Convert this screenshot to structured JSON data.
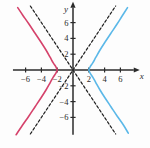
{
  "figure": {
    "background": "#fdfdfd"
  },
  "chart_data": {
    "type": "line",
    "title": "",
    "subtitle": "",
    "xlabel": "x",
    "ylabel": "y",
    "xlim": [
      -7.6,
      8.2
    ],
    "ylim": [
      -8.2,
      8.4
    ],
    "grid": false,
    "legend": null,
    "x_ticks": [
      -6,
      -4,
      -2,
      2,
      4,
      6
    ],
    "y_ticks": [
      6,
      4,
      2,
      -2,
      -4,
      -6
    ],
    "x_tick_labels": [
      "−6",
      "−4",
      "−2",
      "2",
      "4",
      "6"
    ],
    "y_tick_labels": [
      "6",
      "4",
      "2",
      "−2",
      "−4",
      "−6"
    ],
    "origin_label": "",
    "annotations": [],
    "equation": "x²/4 − y²/9 = 1",
    "series": [
      {
        "name": "left-branch",
        "role": "hyperbola-branch",
        "color": "#d5426b",
        "style": "solid",
        "width": 1.6,
        "vertex": [
          -2,
          0
        ],
        "points": [
          [
            -7.2,
            -8.2
          ],
          [
            -6.4,
            -7.0
          ],
          [
            -5.6,
            -5.85
          ],
          [
            -4.8,
            -4.65
          ],
          [
            -4.0,
            -3.45
          ],
          [
            -3.4,
            -2.5
          ],
          [
            -2.9,
            -1.62
          ],
          [
            -2.5,
            -0.9
          ],
          [
            -2.2,
            -0.45
          ],
          [
            -2.05,
            -0.15
          ],
          [
            -2.0,
            0.0
          ],
          [
            -2.05,
            0.15
          ],
          [
            -2.2,
            0.45
          ],
          [
            -2.5,
            0.9
          ],
          [
            -2.9,
            1.62
          ],
          [
            -3.4,
            2.5
          ],
          [
            -4.0,
            3.45
          ],
          [
            -4.8,
            4.65
          ],
          [
            -5.6,
            5.85
          ],
          [
            -6.4,
            7.0
          ],
          [
            -7.0,
            7.9
          ]
        ]
      },
      {
        "name": "right-branch",
        "role": "hyperbola-branch",
        "color": "#5bb8e8",
        "style": "solid",
        "width": 1.6,
        "vertex": [
          2,
          0
        ],
        "points": [
          [
            7.0,
            -8.0
          ],
          [
            6.4,
            -7.0
          ],
          [
            5.6,
            -5.85
          ],
          [
            4.8,
            -4.65
          ],
          [
            4.0,
            -3.45
          ],
          [
            3.4,
            -2.5
          ],
          [
            2.9,
            -1.62
          ],
          [
            2.5,
            -0.9
          ],
          [
            2.2,
            -0.45
          ],
          [
            2.05,
            -0.15
          ],
          [
            2.0,
            0.0
          ],
          [
            2.05,
            0.15
          ],
          [
            2.2,
            0.45
          ],
          [
            2.5,
            0.9
          ],
          [
            2.9,
            1.62
          ],
          [
            3.4,
            2.5
          ],
          [
            4.0,
            3.45
          ],
          [
            4.8,
            4.65
          ],
          [
            5.6,
            5.85
          ],
          [
            6.2,
            6.8
          ],
          [
            6.9,
            7.9
          ]
        ]
      },
      {
        "name": "asymptote-positive-slope",
        "role": "asymptote",
        "color": "#1a1a1a",
        "style": "dashed",
        "width": 1.2,
        "slope": 1.5,
        "points": [
          [
            -5.4,
            -8.1
          ],
          [
            5.4,
            8.1
          ]
        ]
      },
      {
        "name": "asymptote-negative-slope",
        "role": "asymptote",
        "color": "#1a1a1a",
        "style": "dashed",
        "width": 1.2,
        "slope": -1.5,
        "points": [
          [
            -5.4,
            8.1
          ],
          [
            5.4,
            -8.1
          ]
        ]
      }
    ],
    "axis_color": "#2b2b2b"
  }
}
